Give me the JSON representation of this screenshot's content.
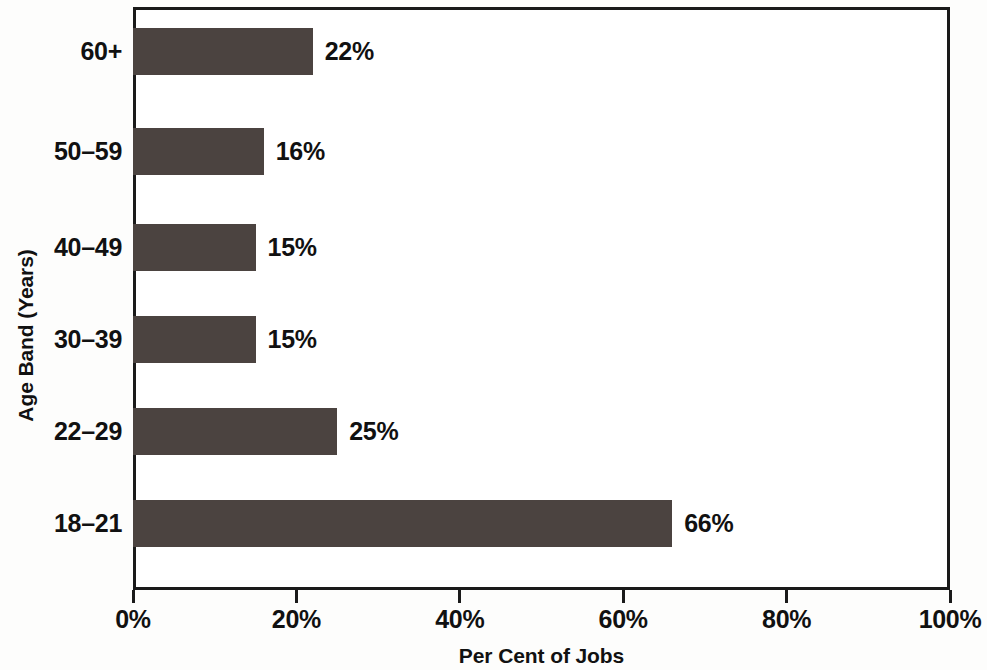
{
  "chart_data": {
    "type": "bar",
    "orientation": "horizontal",
    "title": "",
    "subtitle": "",
    "xlabel": "Per Cent of Jobs",
    "ylabel": "Age Band (Years)",
    "categories": [
      "18–21",
      "22–29",
      "30–39",
      "40–49",
      "50–59",
      "60+"
    ],
    "values": [
      66,
      25,
      15,
      15,
      16,
      22
    ],
    "value_labels": [
      "66%",
      "25%",
      "15%",
      "15%",
      "16%",
      "22%"
    ],
    "xlim": [
      0,
      100
    ],
    "xticks": [
      0,
      20,
      40,
      60,
      80,
      100
    ],
    "xtick_labels": [
      "0%",
      "20%",
      "40%",
      "60%",
      "80%",
      "100%"
    ],
    "grid": false,
    "legend": false,
    "bar_color": "#4b4340",
    "axis_color": "#1a1a1a",
    "text_color": "#111111",
    "background_color": "#ffffff"
  },
  "bars": [
    {
      "category": "60+",
      "value": 22,
      "label": "22%",
      "top": 21
    },
    {
      "category": "50–59",
      "value": 16,
      "label": "16%",
      "top": 121
    },
    {
      "category": "40–49",
      "value": 15,
      "label": "15%",
      "top": 217
    },
    {
      "category": "30–39",
      "value": 15,
      "label": "15%",
      "top": 309
    },
    {
      "category": "22–29",
      "value": 25,
      "label": "25%",
      "top": 401
    },
    {
      "category": "18–21",
      "value": 66,
      "label": "66%",
      "top": 493
    }
  ],
  "xticks": [
    {
      "label": "0%",
      "value": 0
    },
    {
      "label": "20%",
      "value": 20
    },
    {
      "label": "40%",
      "value": 40
    },
    {
      "label": "60%",
      "value": 60
    },
    {
      "label": "80%",
      "value": 80
    },
    {
      "label": "100%",
      "value": 100
    }
  ],
  "axis_titles": {
    "x": "Per Cent of Jobs",
    "y": "Age Band (Years)"
  }
}
